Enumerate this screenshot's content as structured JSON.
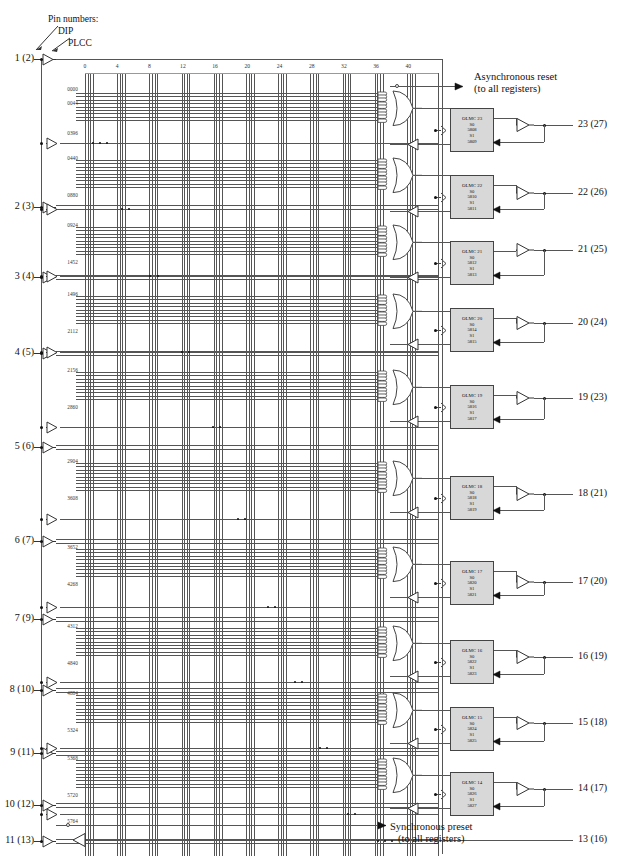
{
  "diagram": {
    "title_note_lines": [
      "Pin numbers:",
      "DIP",
      "PLCC"
    ],
    "async_reset": "Asynchronous reset",
    "async_reset_sub": "(to all registers)",
    "sync_preset": "Synchronous preset",
    "sync_preset_sub": "(to all registers)",
    "colors": {
      "line": "#4a4a4a",
      "block_fill": "#d8d8d8",
      "block_border": "#444444",
      "text": "#111111"
    }
  },
  "column_labels": [
    "0",
    "4",
    "8",
    "12",
    "16",
    "20",
    "24",
    "28",
    "32",
    "36",
    "40"
  ],
  "input_pins": [
    {
      "label": "1 (2)",
      "y": 59
    },
    {
      "label": "2 (3)",
      "y": 207
    },
    {
      "label": "3 (4)",
      "y": 277
    },
    {
      "label": "4 (5)",
      "y": 353
    },
    {
      "label": "5 (6)",
      "y": 447
    },
    {
      "label": "6 (7)",
      "y": 541
    },
    {
      "label": "7 (9)",
      "y": 619
    },
    {
      "label": "8 (10)",
      "y": 690
    },
    {
      "label": "9 (11)",
      "y": 753
    },
    {
      "label": "10 (12)",
      "y": 805
    },
    {
      "label": "11 (13)",
      "y": 841
    }
  ],
  "output_pins": [
    {
      "label": "23 (27)",
      "y": 125
    },
    {
      "label": "22 (26)",
      "y": 193
    },
    {
      "label": "21 (25)",
      "y": 250
    },
    {
      "label": "20 (24)",
      "y": 323
    },
    {
      "label": "19 (23)",
      "y": 398
    },
    {
      "label": "18 (21)",
      "y": 494
    },
    {
      "label": "17 (20)",
      "y": 582
    },
    {
      "label": "16 (19)",
      "y": 657
    },
    {
      "label": "15 (18)",
      "y": 723
    },
    {
      "label": "14 (17)",
      "y": 789
    },
    {
      "label": "13 (16)",
      "y": 840
    }
  ],
  "row_numbers": [
    "0000",
    "0044",
    "0396",
    "0440",
    "0880",
    "0924",
    "1452",
    "1496",
    "2112",
    "2156",
    "2860",
    "2904",
    "3608",
    "3652",
    "4268",
    "4312",
    "4840",
    "4884",
    "5324",
    "5368",
    "5720",
    "5764"
  ],
  "olmc_blocks": [
    {
      "name": "OLMC 23",
      "s0_label": "S0",
      "s0": "5808",
      "s1_label": "S1",
      "s1": "5809",
      "y": 108
    },
    {
      "name": "OLMC 22",
      "s0_label": "S0",
      "s0": "5810",
      "s1_label": "S1",
      "s1": "5811",
      "y": 175
    },
    {
      "name": "OLMC 21",
      "s0_label": "S0",
      "s0": "5812",
      "s1_label": "S1",
      "s1": "5813",
      "y": 241
    },
    {
      "name": "OLMC 20",
      "s0_label": "S0",
      "s0": "5814",
      "s1_label": "S1",
      "s1": "5815",
      "y": 308
    },
    {
      "name": "OLMC 19",
      "s0_label": "S0",
      "s0": "5816",
      "s1_label": "S1",
      "s1": "5817",
      "y": 385
    },
    {
      "name": "OLMC 18",
      "s0_label": "S0",
      "s0": "5818",
      "s1_label": "S1",
      "s1": "5819",
      "y": 476
    },
    {
      "name": "OLMC 17",
      "s0_label": "S0",
      "s0": "5820",
      "s1_label": "S1",
      "s1": "5821",
      "y": 561
    },
    {
      "name": "OLMC 16",
      "s0_label": "S0",
      "s0": "5822",
      "s1_label": "S1",
      "s1": "5823",
      "y": 640
    },
    {
      "name": "OLMC 15",
      "s0_label": "S0",
      "s0": "5824",
      "s1_label": "S1",
      "s1": "5825",
      "y": 707
    },
    {
      "name": "OLMC 14",
      "s0_label": "S0",
      "s0": "5826",
      "s1_label": "S1",
      "s1": "5827",
      "y": 772
    }
  ]
}
